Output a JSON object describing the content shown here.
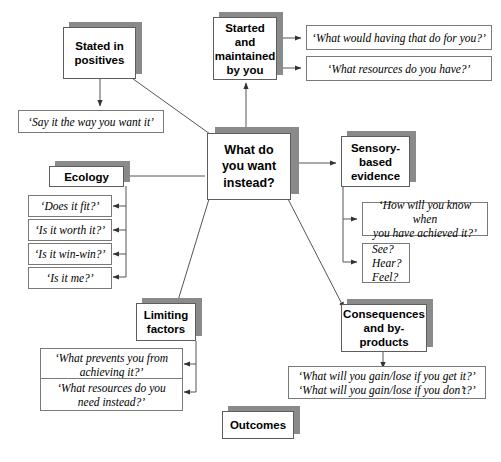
{
  "diagram": {
    "title": "Outcomes",
    "center": {
      "label": "What do\nyou\nwant\ninstead?"
    },
    "branches": [
      {
        "id": "started-maintained",
        "label": "Started and\nmaintained\nby you",
        "leaves": [
          "‘What would having that do for you?’",
          "‘What resources do you have?’"
        ]
      },
      {
        "id": "stated-in-positives",
        "label": "Stated\nin\npositives",
        "leaves": [
          "‘Say it the way you want it’"
        ]
      },
      {
        "id": "ecology",
        "label": "Ecology",
        "leaves": [
          "‘Does it fit?’",
          "‘Is it worth it?’",
          "‘Is it win-win?’",
          "‘Is it me?’"
        ]
      },
      {
        "id": "sensory-based-evidence",
        "label": "Sensory-\nbased\nevidence",
        "leaves": [
          "‘How will you know when\nyou have achieved it?’",
          "See?\nHear?\nFeel?"
        ]
      },
      {
        "id": "limiting-factors",
        "label": "Limiting\nfactors",
        "leaves": [
          "‘What prevents you from\nachieving it?’",
          "‘What resources do you\nneed instead?’"
        ]
      },
      {
        "id": "consequences-and-by-products",
        "label": "Consequences\nand\nby-products",
        "leaves": [
          "‘What will you gain/lose if you get it?’\n‘What will you gain/lose if you don’t?’"
        ]
      }
    ]
  },
  "colors": {
    "card_shadow": "#8a8a8a",
    "card_border": "#5d5d5d",
    "leaf_border": "#7a7a7a",
    "edge": "#555555",
    "background": "#ffffff",
    "text": "#000000"
  }
}
